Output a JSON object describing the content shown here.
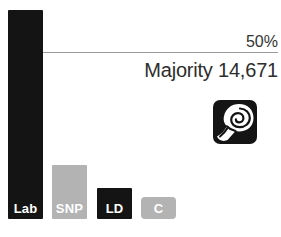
{
  "chart_data": {
    "type": "bar",
    "title": "",
    "categories": [
      "Lab",
      "SNP",
      "LD",
      "C"
    ],
    "values": [
      62.6,
      16.2,
      9.3,
      6.6
    ],
    "ylabel": "vote share %",
    "ylim": [
      0,
      65
    ],
    "grid": false,
    "legend": false,
    "reference_line": {
      "value": 50,
      "label": "50%"
    },
    "annotation": "Majority 14,671",
    "bar_colors": [
      "#141414",
      "#b3b3b3",
      "#141414",
      "#b3b3b3"
    ],
    "bar_label_color": "#ffffff"
  },
  "icons": {
    "party_logo": "labour-rose-icon"
  },
  "colors": {
    "background": "#ffffff",
    "reference_line": "#9b9b9b",
    "text": "#2d2d2d",
    "logo_background": "#141414",
    "logo_foreground": "#ffffff"
  }
}
